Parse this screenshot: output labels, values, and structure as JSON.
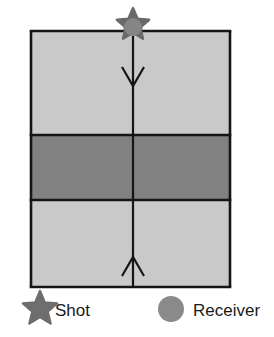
{
  "figure": {
    "title": "",
    "background_color": "#ffffff"
  },
  "model": {
    "frame": {
      "x": 31,
      "y": 31,
      "width": 199,
      "height": 256
    },
    "outline_color": "#151515",
    "outline_width": 2.6,
    "layers": [
      {
        "name": "upper-layer",
        "color": "#c9c9c9",
        "top": 31,
        "bottom": 135
      },
      {
        "name": "middle-layer",
        "color": "#818181",
        "top": 135,
        "bottom": 200
      },
      {
        "name": "lower-layer",
        "color": "#c9c9c9",
        "top": 200,
        "bottom": 287
      }
    ],
    "interfaces": [
      {
        "name": "surface-interface",
        "y": 31
      },
      {
        "name": "top-of-middle-layer-interface",
        "y": 135
      },
      {
        "name": "base-of-middle-layer-interface",
        "y": 200
      },
      {
        "name": "base-of-model-interface",
        "y": 287
      }
    ]
  },
  "raypath": {
    "name": "vertical-raypath",
    "x": 133,
    "top": 31,
    "bottom": 287,
    "color": "#151515",
    "width": 2.2,
    "arrows": [
      {
        "name": "downgoing-ray-arrow",
        "direction": "down",
        "tip_y": 86
      },
      {
        "name": "upgoing-ray-arrow",
        "direction": "up",
        "tip_y": 257
      }
    ]
  },
  "symbols": {
    "shot": {
      "label": "Shot",
      "glyph": "star-icon",
      "color": "#696969",
      "position": {
        "x": 133,
        "y": 25
      },
      "radius": 17
    },
    "receiver": {
      "label": "Receiver",
      "glyph": "circle-icon",
      "color": "#858585",
      "position": {
        "x": 133,
        "y": 26
      },
      "radius": 9
    }
  },
  "legend": {
    "items": [
      {
        "key": "shot",
        "glyph": "star-icon",
        "label": "Shot",
        "color": "#6e6e6e",
        "icon_x": 22,
        "icon_y": 309,
        "icon_radius": 18,
        "label_x": 55,
        "label_y": 316
      },
      {
        "key": "receiver",
        "glyph": "circle-icon",
        "label": "Receiver",
        "color": "#8a8a8a",
        "icon_x": 171,
        "icon_y": 309,
        "icon_radius": 13,
        "label_x": 193,
        "label_y": 316
      }
    ]
  }
}
